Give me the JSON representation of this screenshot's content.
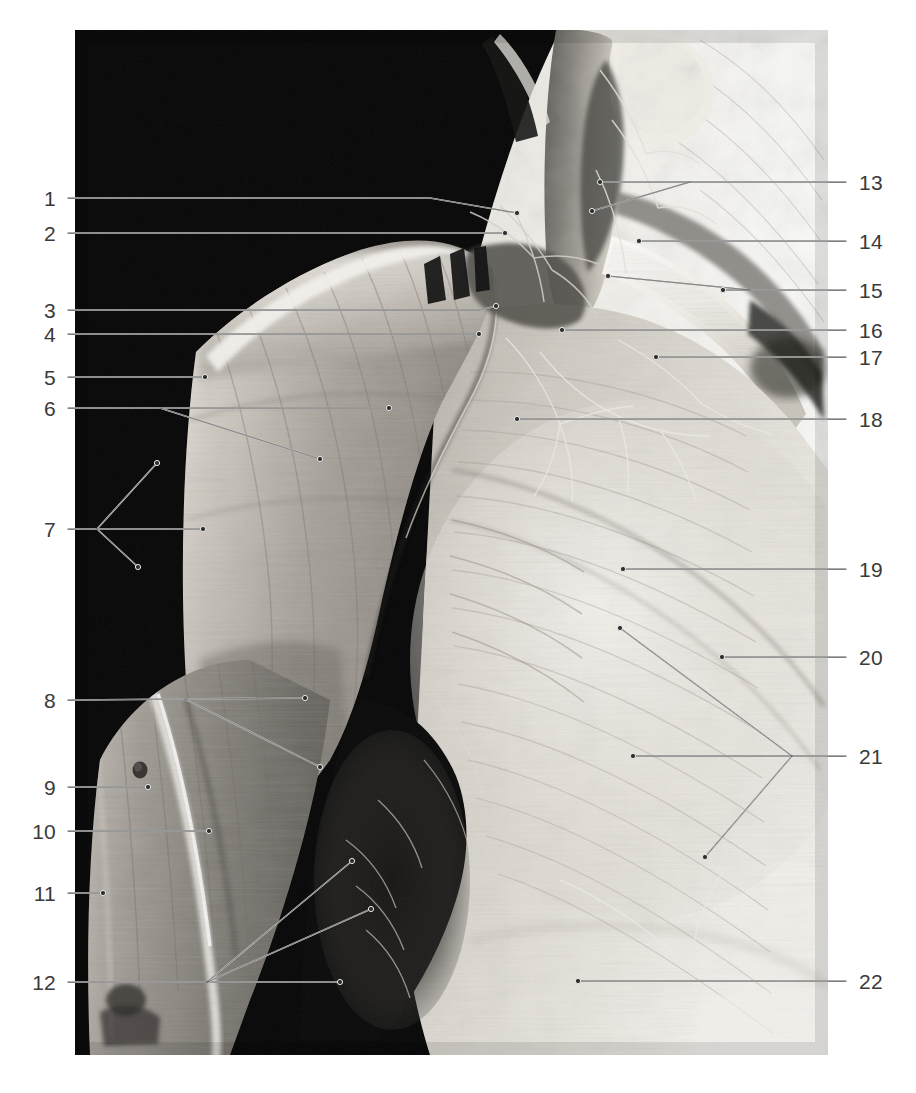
{
  "plate": {
    "kind": "anatomical-dissection-photograph",
    "region": "right shoulder, axilla and anterior thoracic wall, superficial dissection",
    "palette": {
      "background": "#ffffff",
      "photo_black": "#050505",
      "tissue_mid": "#9a968f",
      "tissue_light": "#e2dfd8",
      "tissue_highlight": "#f4f2ee",
      "tissue_dark": "#51504c",
      "leader_line": "#555555",
      "leader_line_on_black": "#d8d8d8",
      "label_text": "#3a3a3a"
    },
    "frame": {
      "x": 75,
      "y": 30,
      "width": 753,
      "height": 1025
    }
  },
  "labels": {
    "left": [
      {
        "id": "1",
        "text": "1",
        "x": 56,
        "y": 198
      },
      {
        "id": "2",
        "text": "2",
        "x": 56,
        "y": 233
      },
      {
        "id": "3",
        "text": "3",
        "x": 56,
        "y": 310
      },
      {
        "id": "4",
        "text": "4",
        "x": 56,
        "y": 334
      },
      {
        "id": "5",
        "text": "5",
        "x": 56,
        "y": 377
      },
      {
        "id": "6",
        "text": "6",
        "x": 56,
        "y": 408
      },
      {
        "id": "7",
        "text": "7",
        "x": 56,
        "y": 529
      },
      {
        "id": "8",
        "text": "8",
        "x": 56,
        "y": 700
      },
      {
        "id": "9",
        "text": "9",
        "x": 56,
        "y": 787
      },
      {
        "id": "10",
        "text": "10",
        "x": 56,
        "y": 831
      },
      {
        "id": "11",
        "text": "11",
        "x": 56,
        "y": 893
      },
      {
        "id": "12",
        "text": "12",
        "x": 56,
        "y": 982
      }
    ],
    "right": [
      {
        "id": "13",
        "text": "13",
        "x": 859,
        "y": 182
      },
      {
        "id": "14",
        "text": "14",
        "x": 859,
        "y": 241
      },
      {
        "id": "15",
        "text": "15",
        "x": 859,
        "y": 290
      },
      {
        "id": "16",
        "text": "16",
        "x": 859,
        "y": 330
      },
      {
        "id": "17",
        "text": "17",
        "x": 859,
        "y": 357
      },
      {
        "id": "18",
        "text": "18",
        "x": 859,
        "y": 419
      },
      {
        "id": "19",
        "text": "19",
        "x": 859,
        "y": 569
      },
      {
        "id": "20",
        "text": "20",
        "x": 859,
        "y": 657
      },
      {
        "id": "21",
        "text": "21",
        "x": 859,
        "y": 756
      },
      {
        "id": "22",
        "text": "22",
        "x": 859,
        "y": 981
      }
    ]
  },
  "leaders": {
    "left": [
      {
        "id": "1",
        "path": "M 68 198 L 430 198 L 517 213"
      },
      {
        "id": "2",
        "path": "M 68 233 L 505 233"
      },
      {
        "id": "3",
        "path": "M 68 310 L 480 310 L 496 306"
      },
      {
        "id": "4",
        "path": "M 68 334 L 479 334"
      },
      {
        "id": "5",
        "path": "M 68 377 L 205 377"
      },
      {
        "id": "6",
        "path": "M 68 408 L 389 408 M 160 408 L 320 459"
      },
      {
        "id": "7",
        "path": "M 68 529 L 97 529 M 97 529 L 157 463 M 97 529 L 203 529 M 97 529 L 138 567"
      },
      {
        "id": "8",
        "path": "M 68 700 L 305 698 M 185 699 L 320 767"
      },
      {
        "id": "9",
        "path": "M 68 787 L 148 787"
      },
      {
        "id": "10",
        "path": "M 68 831 L 209 831"
      },
      {
        "id": "11",
        "path": "M 68 893 L 103 893"
      },
      {
        "id": "12",
        "path": "M 68 982 L 207 982 M 207 982 L 352 861 M 207 982 L 371 909 M 207 982 L 340 982"
      }
    ],
    "right": [
      {
        "id": "13",
        "path": "M 846 182 L 600 182 M 690 182 L 592 211"
      },
      {
        "id": "14",
        "path": "M 846 241 L 639 241"
      },
      {
        "id": "15",
        "path": "M 846 290 L 723 290 M 750 290 L 608 276"
      },
      {
        "id": "16",
        "path": "M 846 330 L 562 330"
      },
      {
        "id": "17",
        "path": "M 846 357 L 656 357"
      },
      {
        "id": "18",
        "path": "M 846 419 L 517 419"
      },
      {
        "id": "19",
        "path": "M 846 569 L 623 569"
      },
      {
        "id": "20",
        "path": "M 846 657 L 722 657"
      },
      {
        "id": "21",
        "path": "M 846 756 L 792 756 M 792 756 L 620 628 M 792 756 L 633 756 M 792 756 L 705 857"
      },
      {
        "id": "22",
        "path": "M 846 981 L 578 981"
      }
    ]
  },
  "dots": {
    "radius": 2.6,
    "left": [
      {
        "id": "1",
        "x": 517,
        "y": 213
      },
      {
        "id": "2",
        "x": 505,
        "y": 233
      },
      {
        "id": "3",
        "x": 496,
        "y": 306
      },
      {
        "id": "4",
        "x": 479,
        "y": 334
      },
      {
        "id": "5",
        "x": 205,
        "y": 377
      },
      {
        "id": "6",
        "x": 389,
        "y": 408
      },
      {
        "id": "6b",
        "x": 320,
        "y": 459
      },
      {
        "id": "7a",
        "x": 157,
        "y": 463
      },
      {
        "id": "7b",
        "x": 203,
        "y": 529
      },
      {
        "id": "7c",
        "x": 138,
        "y": 567
      },
      {
        "id": "8a",
        "x": 305,
        "y": 698
      },
      {
        "id": "8b",
        "x": 320,
        "y": 767
      },
      {
        "id": "9",
        "x": 148,
        "y": 787
      },
      {
        "id": "10",
        "x": 209,
        "y": 831
      },
      {
        "id": "11",
        "x": 103,
        "y": 893
      },
      {
        "id": "12a",
        "x": 352,
        "y": 861
      },
      {
        "id": "12b",
        "x": 371,
        "y": 909
      },
      {
        "id": "12c",
        "x": 340,
        "y": 982
      }
    ],
    "right": [
      {
        "id": "13",
        "x": 600,
        "y": 182
      },
      {
        "id": "13b",
        "x": 592,
        "y": 211
      },
      {
        "id": "14",
        "x": 639,
        "y": 241
      },
      {
        "id": "15",
        "x": 723,
        "y": 290
      },
      {
        "id": "15b",
        "x": 608,
        "y": 276
      },
      {
        "id": "16",
        "x": 562,
        "y": 330
      },
      {
        "id": "17",
        "x": 656,
        "y": 357
      },
      {
        "id": "18",
        "x": 517,
        "y": 419
      },
      {
        "id": "19",
        "x": 623,
        "y": 569
      },
      {
        "id": "20",
        "x": 722,
        "y": 657
      },
      {
        "id": "21a",
        "x": 620,
        "y": 628
      },
      {
        "id": "21b",
        "x": 633,
        "y": 756
      },
      {
        "id": "21c",
        "x": 705,
        "y": 857
      },
      {
        "id": "22",
        "x": 578,
        "y": 981
      }
    ]
  }
}
